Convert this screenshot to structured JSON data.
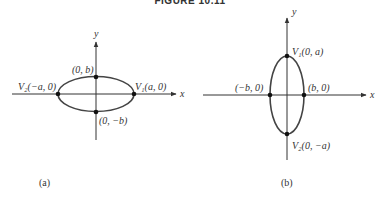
{
  "figure": {
    "title": "FIGURE 10.11",
    "panels": [
      {
        "caption": "(a)",
        "axis_x": "x",
        "axis_y": "y",
        "points": {
          "left": "V₂(−a, 0)",
          "right": "V₁(a, 0)",
          "top": "(0, b)",
          "bottom": "(0, −b)"
        }
      },
      {
        "caption": "(b)",
        "axis_x": "x",
        "axis_y": "y",
        "points": {
          "left": "(−b, 0)",
          "right": "(b, 0)",
          "top": "V₁(0, a)",
          "bottom": "V₂(0, −a)"
        }
      }
    ]
  }
}
